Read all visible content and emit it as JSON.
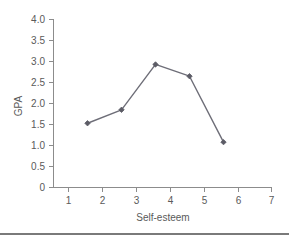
{
  "chart_data": {
    "type": "line",
    "title": "",
    "xlabel": "Self-esteem",
    "ylabel": "GPA",
    "x": [
      1,
      2,
      3,
      4,
      5
    ],
    "values": [
      1.53,
      1.85,
      2.93,
      2.65,
      1.08
    ],
    "series": [
      {
        "name": "GPA by Self-esteem",
        "values": [
          1.53,
          1.85,
          2.93,
          2.65,
          1.08
        ]
      }
    ],
    "xlim": [
      0,
      7
    ],
    "ylim": [
      0,
      4.0
    ],
    "x_ticks": [
      1,
      2,
      3,
      4,
      5,
      6,
      7
    ],
    "x_tick_labels": [
      "1",
      "2",
      "3",
      "4",
      "5",
      "6",
      "7"
    ],
    "y_ticks": [
      0,
      0.5,
      1.0,
      1.5,
      2.0,
      2.5,
      3.0,
      3.5,
      4.0
    ],
    "y_tick_labels": [
      "0",
      "0.5",
      "1.0",
      "1.5",
      "2.0",
      "2.5",
      "3.0",
      "3.5",
      "4.0"
    ],
    "grid": false,
    "legend": false,
    "legend_position": "none",
    "marker": "diamond",
    "line_color": "#6e6e78",
    "marker_color": "#5c5c66",
    "axis_color": "#8c8c8c",
    "text_color": "#5a5a5a",
    "background": "#ffffff"
  }
}
